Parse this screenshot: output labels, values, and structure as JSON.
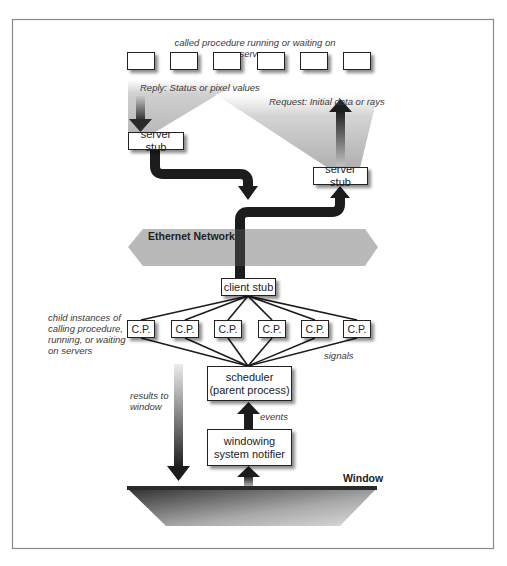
{
  "figure": {
    "top_caption": "called procedure running or waiting on servers",
    "reply_label": "Reply: Status or pixel values",
    "request_label": "Request: Initial data or rays",
    "server_stub_left": "server stub",
    "server_stub_right": "server stub",
    "network_label": "Ethernet Network",
    "client_stub": "client stub",
    "child_caption": [
      "child instances of",
      "calling procedure,",
      "running, or waiting",
      "on servers"
    ],
    "cp_boxes": [
      "C.P.",
      "C.P.",
      "C.P.",
      "C.P.",
      "C.P.",
      "C.P."
    ],
    "signals_label": "signals",
    "scheduler": [
      "scheduler",
      "(parent process)"
    ],
    "events_label": "events",
    "notifier": [
      "windowing",
      "system notifier"
    ],
    "results_label": [
      "results to",
      "window"
    ],
    "window_label": "Window",
    "server_box_count": 6
  },
  "colors": {
    "frame": "#8a8a8a",
    "arrow_dark": "#1c1c1c",
    "network_fill": "#b9b9b9",
    "fan_fill": "#c8c8c8",
    "window_dark": "#3a3a3a",
    "window_light": "#cfcfcf"
  }
}
